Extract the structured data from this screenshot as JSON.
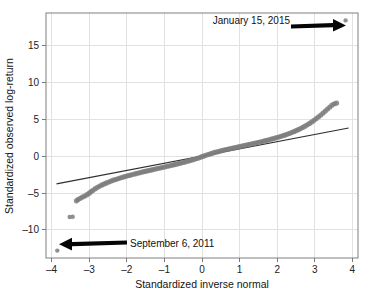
{
  "chart_data": {
    "type": "scatter",
    "title": "",
    "xlabel": "Standardized inverse normal",
    "ylabel": "Standardized observed log-return",
    "xlim": [
      -4.15,
      4.15
    ],
    "ylim": [
      -13.8,
      19.4
    ],
    "xticks": [
      -4,
      -3,
      -2,
      -1,
      0,
      1,
      2,
      3,
      4
    ],
    "xtick_labels": [
      "–4",
      "–3",
      "–2",
      "–1",
      "0",
      "1",
      "2",
      "3",
      "4"
    ],
    "yticks": [
      15,
      10,
      5,
      0,
      -5,
      -10
    ],
    "ytick_labels": [
      "15",
      "10",
      "5",
      "0",
      "–5",
      "–10"
    ],
    "grid": true,
    "legend": "none",
    "series": [
      {
        "name": "Standardized observed log-return vs standardized inverse normal",
        "marker": "circle",
        "color": "#7d7d7d",
        "points": [
          [
            -3.85,
            -12.8
          ],
          [
            -3.52,
            -8.25
          ],
          [
            -3.44,
            -8.22
          ],
          [
            -3.34,
            -6.05
          ],
          [
            -3.3,
            -5.88
          ],
          [
            -3.24,
            -5.72
          ],
          [
            -3.18,
            -5.55
          ],
          [
            -3.12,
            -5.4
          ],
          [
            -3.06,
            -5.22
          ],
          [
            -3.0,
            -5.02
          ],
          [
            -2.95,
            -4.8
          ],
          [
            -2.9,
            -4.62
          ],
          [
            -2.84,
            -4.4
          ],
          [
            -2.78,
            -4.22
          ],
          [
            -2.72,
            -4.05
          ],
          [
            -2.66,
            -3.9
          ],
          [
            -2.6,
            -3.76
          ],
          [
            -2.54,
            -3.62
          ],
          [
            -2.48,
            -3.5
          ],
          [
            -2.42,
            -3.38
          ],
          [
            -2.36,
            -3.26
          ],
          [
            -2.3,
            -3.16
          ],
          [
            -2.24,
            -3.06
          ],
          [
            -2.18,
            -2.96
          ],
          [
            -2.12,
            -2.87
          ],
          [
            -2.06,
            -2.78
          ],
          [
            -2.0,
            -2.69
          ],
          [
            -1.94,
            -2.61
          ],
          [
            -1.88,
            -2.53
          ],
          [
            -1.82,
            -2.45
          ],
          [
            -1.76,
            -2.37
          ],
          [
            -1.7,
            -2.29
          ],
          [
            -1.64,
            -2.22
          ],
          [
            -1.58,
            -2.14
          ],
          [
            -1.52,
            -2.07
          ],
          [
            -1.46,
            -2.0
          ],
          [
            -1.4,
            -1.93
          ],
          [
            -1.34,
            -1.86
          ],
          [
            -1.28,
            -1.79
          ],
          [
            -1.22,
            -1.72
          ],
          [
            -1.16,
            -1.65
          ],
          [
            -1.1,
            -1.58
          ],
          [
            -1.04,
            -1.51
          ],
          [
            -0.98,
            -1.44
          ],
          [
            -0.92,
            -1.37
          ],
          [
            -0.86,
            -1.3
          ],
          [
            -0.8,
            -1.23
          ],
          [
            -0.74,
            -1.16
          ],
          [
            -0.68,
            -1.08
          ],
          [
            -0.62,
            -1.01
          ],
          [
            -0.56,
            -0.93
          ],
          [
            -0.5,
            -0.85
          ],
          [
            -0.44,
            -0.77
          ],
          [
            -0.38,
            -0.69
          ],
          [
            -0.32,
            -0.6
          ],
          [
            -0.26,
            -0.51
          ],
          [
            -0.2,
            -0.42
          ],
          [
            -0.14,
            -0.32
          ],
          [
            -0.08,
            -0.22
          ],
          [
            -0.02,
            -0.11
          ],
          [
            0.04,
            0.0
          ],
          [
            0.1,
            0.11
          ],
          [
            0.16,
            0.21
          ],
          [
            0.22,
            0.31
          ],
          [
            0.28,
            0.41
          ],
          [
            0.34,
            0.5
          ],
          [
            0.4,
            0.58
          ],
          [
            0.46,
            0.66
          ],
          [
            0.52,
            0.74
          ],
          [
            0.58,
            0.82
          ],
          [
            0.64,
            0.89
          ],
          [
            0.7,
            0.96
          ],
          [
            0.76,
            1.03
          ],
          [
            0.82,
            1.1
          ],
          [
            0.88,
            1.17
          ],
          [
            0.94,
            1.24
          ],
          [
            1.0,
            1.31
          ],
          [
            1.06,
            1.37
          ],
          [
            1.12,
            1.44
          ],
          [
            1.18,
            1.51
          ],
          [
            1.24,
            1.58
          ],
          [
            1.3,
            1.64
          ],
          [
            1.36,
            1.71
          ],
          [
            1.42,
            1.78
          ],
          [
            1.48,
            1.85
          ],
          [
            1.54,
            1.92
          ],
          [
            1.6,
            1.99
          ],
          [
            1.66,
            2.07
          ],
          [
            1.72,
            2.14
          ],
          [
            1.78,
            2.22
          ],
          [
            1.84,
            2.3
          ],
          [
            1.9,
            2.38
          ],
          [
            1.96,
            2.47
          ],
          [
            2.02,
            2.56
          ],
          [
            2.08,
            2.65
          ],
          [
            2.14,
            2.75
          ],
          [
            2.2,
            2.85
          ],
          [
            2.26,
            2.96
          ],
          [
            2.32,
            3.07
          ],
          [
            2.38,
            3.19
          ],
          [
            2.44,
            3.32
          ],
          [
            2.5,
            3.45
          ],
          [
            2.56,
            3.59
          ],
          [
            2.62,
            3.74
          ],
          [
            2.68,
            3.9
          ],
          [
            2.74,
            4.07
          ],
          [
            2.8,
            4.25
          ],
          [
            2.86,
            4.44
          ],
          [
            2.92,
            4.64
          ],
          [
            2.98,
            4.86
          ],
          [
            3.04,
            5.09
          ],
          [
            3.1,
            5.33
          ],
          [
            3.16,
            5.58
          ],
          [
            3.22,
            5.84
          ],
          [
            3.28,
            6.11
          ],
          [
            3.34,
            6.39
          ],
          [
            3.4,
            6.66
          ],
          [
            3.46,
            6.92
          ],
          [
            3.52,
            7.1
          ],
          [
            3.58,
            7.2
          ],
          [
            3.82,
            18.4
          ]
        ]
      }
    ],
    "reference_line": {
      "name": "normal reference line",
      "color": "#2f2f2f",
      "x1": -3.87,
      "y1": -3.75,
      "x2": 3.9,
      "y2": 3.82
    },
    "annotations": [
      {
        "id": "annotation-january-2015",
        "label": "January 15, 2015",
        "points_to": [
          3.82,
          18.4
        ],
        "arrow_direction": "right"
      },
      {
        "id": "annotation-september-2011",
        "label": "September 6, 2011",
        "points_to": [
          -3.85,
          -12.8
        ],
        "arrow_direction": "left"
      }
    ]
  },
  "colors": {
    "background": "#ffffff",
    "grid": "#e2e2e2",
    "frame": "#8a8a8a",
    "points": "#7d7d7d",
    "reference_line": "#2f2f2f",
    "arrow": "#050505",
    "text": "#141414"
  }
}
